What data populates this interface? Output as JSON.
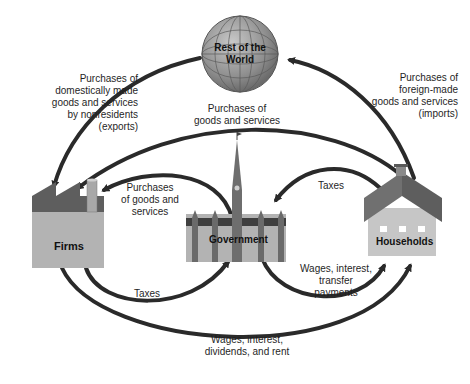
{
  "nodes": {
    "world": {
      "label": "Rest of the\nWorld"
    },
    "firms": {
      "label": "Firms"
    },
    "government": {
      "label": "Government"
    },
    "households": {
      "label": "Households"
    }
  },
  "flows": {
    "exports": "Purchases of\ndomestically made\ngoods and services\nby nonresidents\n(exports)",
    "imports": "Purchases of\nforeign-made\ngoods and services\n(imports)",
    "hh_to_firms_purchases": "Purchases of\ngoods and services",
    "gov_to_firms_purchases": "Purchases\nof goods and\nservices",
    "hh_to_gov_taxes": "Taxes",
    "firms_to_gov_taxes": "Taxes",
    "gov_to_hh_payments": "Wages, interest,\ntransfer\npayments",
    "firms_to_hh_income": "Wages, interest,\ndividends, and rent"
  },
  "colors": {
    "arrow": "#2a2a2a",
    "globe": "#9a9a9a",
    "building_dark": "#5e5e5e",
    "building_light": "#b3b3b3",
    "roof": "#6e6e6e"
  }
}
